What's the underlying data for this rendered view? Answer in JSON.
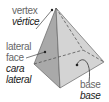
{
  "labels": {
    "vertex": {
      "en": "vertex",
      "es": "vértice"
    },
    "lateral_face": {
      "en_line1": "lateral",
      "en_line2": "face",
      "es_line1": "cara",
      "es_line2": "lateral"
    },
    "base": {
      "en": "base",
      "es": "base"
    }
  },
  "colors": {
    "face_left": "#a9a9a9",
    "face_front": "#cfcfcf",
    "base": "#e0e0e0",
    "outline": "#555555"
  }
}
